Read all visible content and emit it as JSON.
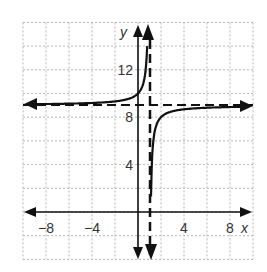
{
  "chart_data": {
    "type": "line",
    "title": "",
    "xlabel": "x",
    "ylabel": "y",
    "xlim": [
      -10,
      10
    ],
    "ylim": [
      -4,
      16
    ],
    "grid": true,
    "grid_step": 2,
    "x_ticks": [
      {
        "value": -8,
        "label": "−8"
      },
      {
        "value": -4,
        "label": "−4"
      },
      {
        "value": 4,
        "label": "4"
      },
      {
        "value": 8,
        "label": "8"
      }
    ],
    "y_ticks": [
      {
        "value": 4,
        "label": "4"
      },
      {
        "value": 8,
        "label": "8"
      },
      {
        "value": 12,
        "label": "12"
      }
    ],
    "function": "y = -1/(x - 1) + 9",
    "asymptotes": {
      "vertical": 1,
      "horizontal": 9
    },
    "series": [
      {
        "name": "left branch",
        "x": [
          -10,
          -6,
          -4,
          -2,
          -1,
          0,
          0.5,
          0.8
        ],
        "y": [
          9.09,
          9.14,
          9.2,
          9.33,
          9.5,
          10,
          11,
          14
        ]
      },
      {
        "name": "right branch",
        "x": [
          1.2,
          1.5,
          2,
          3,
          4,
          6,
          8,
          10
        ],
        "y": [
          4,
          7,
          8,
          8.5,
          8.67,
          8.8,
          8.86,
          8.89
        ]
      }
    ]
  }
}
